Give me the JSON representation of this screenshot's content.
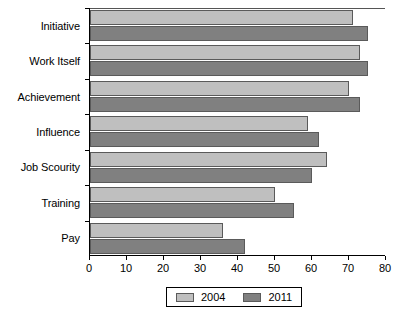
{
  "chart_data": {
    "type": "bar",
    "orientation": "horizontal",
    "title": "",
    "xlabel": "",
    "ylabel": "",
    "categories": [
      "Initiative",
      "Work Itself",
      "Achievement",
      "Influence",
      "Job Scourity",
      "Training",
      "Pay"
    ],
    "series": [
      {
        "name": "2004",
        "color": "#bfbfbf",
        "values": [
          71,
          73,
          70,
          59,
          64,
          50,
          36
        ]
      },
      {
        "name": "2011",
        "color": "#808080",
        "values": [
          75,
          75,
          73,
          62,
          60,
          55,
          42
        ]
      }
    ],
    "xlim": [
      0,
      80
    ],
    "xticks": [
      0,
      10,
      20,
      30,
      40,
      50,
      60,
      70,
      80
    ],
    "xtick_labels": [
      "0",
      "10",
      "20",
      "30",
      "40",
      "50",
      "60",
      "70",
      "80"
    ],
    "grid": false,
    "legend_position": "bottom-center",
    "legend_entries": [
      "2004",
      "2011"
    ]
  }
}
